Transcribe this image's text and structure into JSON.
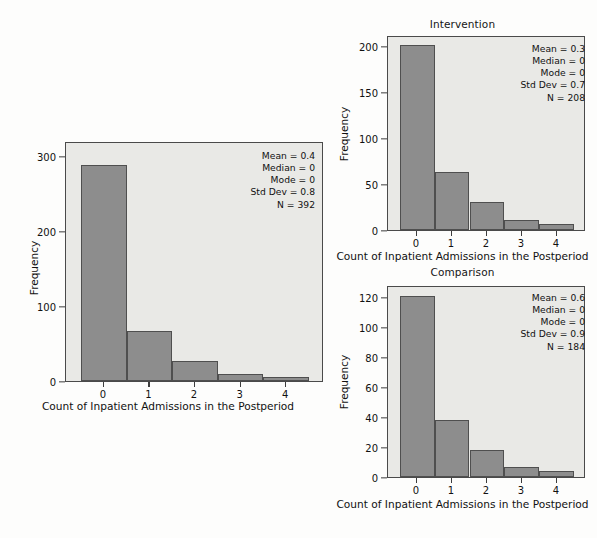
{
  "figure": {
    "background_color": "#fdfdfc",
    "bar_fill_color": "#8d8d8d",
    "bar_edge_color": "#4f4f4f",
    "plot_background_color": "#e9e9e6"
  },
  "chart_data": [
    {
      "id": "total",
      "type": "bar",
      "title": "",
      "categories": [
        "0",
        "1",
        "2",
        "3",
        "4"
      ],
      "values": [
        288,
        67,
        27,
        9,
        5
      ],
      "xlabel": "Count of Inpatient Admissions in the Postperiod",
      "ylabel": "Frequency",
      "ylim": [
        0,
        320
      ],
      "yticks": [
        0,
        100,
        200,
        300
      ],
      "ytick_labels": [
        "0",
        "100",
        "200",
        "300"
      ],
      "grid": false,
      "annotations": {
        "mean": "Mean = 0.4",
        "median": "Median = 0",
        "mode": "Mode = 0",
        "std_dev": "Std Dev = 0.8",
        "n": "N = 392"
      }
    },
    {
      "id": "intervention",
      "type": "bar",
      "title": "Intervention",
      "categories": [
        "0",
        "1",
        "2",
        "3",
        "4"
      ],
      "values": [
        201,
        63,
        30,
        11,
        6
      ],
      "xlabel": "Count of Inpatient Admissions in the Postperiod",
      "ylabel": "Frequency",
      "ylim": [
        0,
        212
      ],
      "yticks": [
        0,
        50,
        100,
        150,
        200
      ],
      "ytick_labels": [
        "0",
        "50",
        "100",
        "150",
        "200"
      ],
      "grid": false,
      "annotations": {
        "mean": "Mean = 0.3",
        "median": "Median = 0",
        "mode": "Mode = 0",
        "std_dev": "Std Dev = 0.7",
        "n": "N = 208"
      }
    },
    {
      "id": "comparison",
      "type": "bar",
      "title": "Comparison",
      "categories": [
        "0",
        "1",
        "2",
        "3",
        "4"
      ],
      "values": [
        121,
        38,
        18,
        7,
        4
      ],
      "xlabel": "Count of Inpatient Admissions in the Postperiod",
      "ylabel": "Frequency",
      "ylim": [
        0,
        128
      ],
      "yticks": [
        0,
        20,
        40,
        60,
        80,
        100,
        120
      ],
      "ytick_labels": [
        "0",
        "20",
        "40",
        "60",
        "80",
        "100",
        "120"
      ],
      "grid": false,
      "annotations": {
        "mean": "Mean = 0.6",
        "median": "Median = 0",
        "mode": "Mode = 0",
        "std_dev": "Std Dev = 0.9",
        "n": "N = 184"
      }
    }
  ]
}
